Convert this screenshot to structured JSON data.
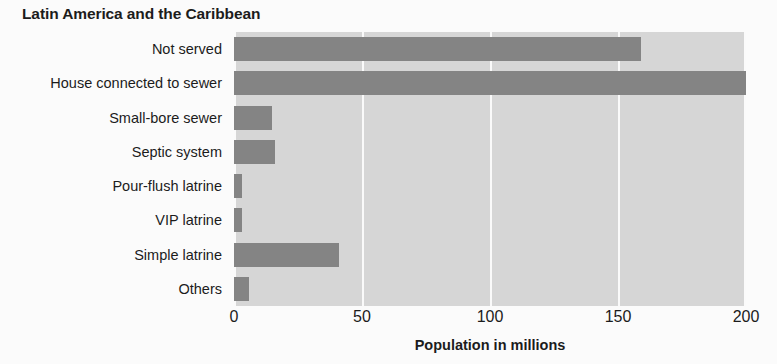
{
  "chart_data": {
    "type": "bar",
    "orientation": "horizontal",
    "title": "Latin America and the Caribbean",
    "xlabel": "Population in millions",
    "ylabel": "",
    "xlim": [
      0,
      200
    ],
    "xticks": [
      0,
      50,
      100,
      150,
      200
    ],
    "xtick_labels": [
      "0",
      "50",
      "100",
      "150",
      "200"
    ],
    "grid": "vertical",
    "legend": "none",
    "bar_color": "#848484",
    "plot_background": "#d6d6d6",
    "page_background": "#fbfbfb",
    "categories": [
      "Not served",
      "House connected to sewer",
      "Small-bore sewer",
      "Septic system",
      "Pour-flush latrine",
      "VIP latrine",
      "Simple latrine",
      "Others"
    ],
    "values": [
      159,
      200,
      15,
      16,
      3,
      3,
      41,
      6
    ],
    "series": [
      {
        "name": "Population in millions",
        "values": [
          159,
          200,
          15,
          16,
          3,
          3,
          41,
          6
        ]
      }
    ]
  }
}
